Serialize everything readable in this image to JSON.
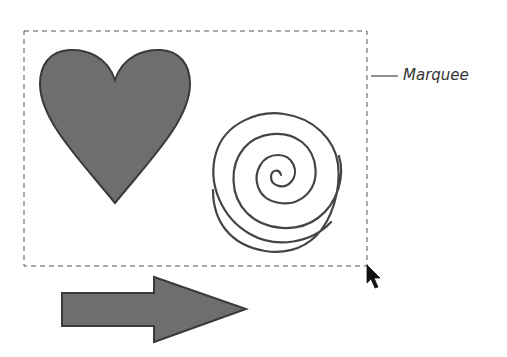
{
  "diagram": {
    "callout_label": "Marquee",
    "marquee": {
      "x": 24,
      "y": 31,
      "width": 343,
      "height": 235,
      "stroke": "#555555",
      "dash": "5,4"
    },
    "shapes": [
      {
        "name": "heart",
        "fill": "#6e6e6e",
        "stroke": "#3a3a3a"
      },
      {
        "name": "spiral",
        "stroke": "#444444"
      },
      {
        "name": "arrow",
        "fill": "#6e6e6e",
        "stroke": "#3a3a3a"
      }
    ],
    "cursor": {
      "x": 367,
      "y": 266,
      "icon": "arrow-pointer-icon"
    }
  }
}
